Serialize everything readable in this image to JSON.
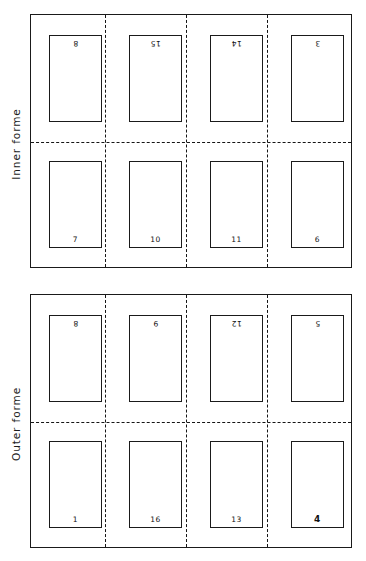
{
  "figure": {
    "type": "imposition-diagram",
    "colors": {
      "ink": "#1a1a1a",
      "paper": "#ffffff"
    }
  },
  "formes": [
    {
      "id": "inner-forme",
      "label": "Inner forme",
      "rows": [
        {
          "position": "top",
          "orientation": "inverted",
          "pages": [
            {
              "number": "8",
              "emphasis": "normal"
            },
            {
              "number": "15",
              "emphasis": "normal"
            },
            {
              "number": "14",
              "emphasis": "normal"
            },
            {
              "number": "3",
              "emphasis": "normal"
            }
          ]
        },
        {
          "position": "bottom",
          "orientation": "upright",
          "pages": [
            {
              "number": "7",
              "emphasis": "normal"
            },
            {
              "number": "10",
              "emphasis": "normal"
            },
            {
              "number": "11",
              "emphasis": "normal"
            },
            {
              "number": "6",
              "emphasis": "normal"
            }
          ]
        }
      ]
    },
    {
      "id": "outer-forme",
      "label": "Outer forme",
      "rows": [
        {
          "position": "top",
          "orientation": "inverted",
          "pages": [
            {
              "number": "8",
              "emphasis": "normal"
            },
            {
              "number": "9",
              "emphasis": "normal"
            },
            {
              "number": "12",
              "emphasis": "normal"
            },
            {
              "number": "5",
              "emphasis": "normal"
            }
          ]
        },
        {
          "position": "bottom",
          "orientation": "upright",
          "pages": [
            {
              "number": "1",
              "emphasis": "normal"
            },
            {
              "number": "16",
              "emphasis": "normal"
            },
            {
              "number": "13",
              "emphasis": "normal"
            },
            {
              "number": "4",
              "emphasis": "heavy"
            }
          ]
        }
      ]
    }
  ]
}
